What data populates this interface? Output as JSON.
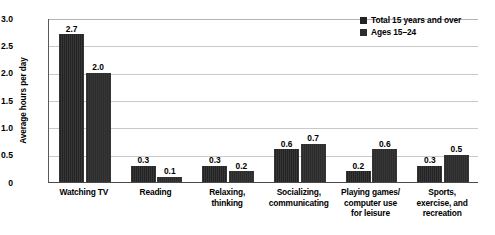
{
  "chart_data": {
    "type": "bar",
    "title": "",
    "subtitle": "",
    "xlabel": "",
    "ylabel": "Average hours per day",
    "ylim": [
      0,
      3.0
    ],
    "yticks": [
      0,
      0.5,
      1.0,
      1.5,
      2.0,
      2.5,
      3.0
    ],
    "ytick_labels": [
      "0",
      "0.5",
      "1.0",
      "1.5",
      "2.0",
      "2.5",
      "3.0"
    ],
    "grid": true,
    "legend_position": "top-right",
    "orientation": "vertical",
    "grouping": "grouped",
    "categories": [
      "Watching TV",
      "Reading",
      "Relaxing,\nthinking",
      "Socializing,\ncommunicating",
      "Playing games/\ncomputer use\nfor leisure",
      "Sports,\nexercise, and\nrecreation"
    ],
    "category_lines": [
      [
        "Watching TV"
      ],
      [
        "Reading"
      ],
      [
        "Relaxing,",
        "thinking"
      ],
      [
        "Socializing,",
        "communicating"
      ],
      [
        "Playing games/",
        "computer use",
        "for leisure"
      ],
      [
        "Sports,",
        "exercise, and",
        "recreation"
      ]
    ],
    "series": [
      {
        "name": "Total 15 years and over",
        "color": "#232323",
        "values": [
          2.7,
          0.3,
          0.3,
          0.6,
          0.2,
          0.3
        ],
        "value_labels": [
          "2.7",
          "0.3",
          "0.3",
          "0.6",
          "0.2",
          "0.3"
        ]
      },
      {
        "name": "Ages 15–24",
        "color": "#2c2c2c",
        "values": [
          2.0,
          0.1,
          0.2,
          0.7,
          0.6,
          0.5
        ],
        "value_labels": [
          "2.0",
          "0.1",
          "0.2",
          "0.7",
          "0.6",
          "0.5"
        ]
      }
    ]
  },
  "legend": {
    "items": [
      {
        "label": "Total 15 years and over"
      },
      {
        "label": "Ages 15–24"
      }
    ]
  },
  "colors": {
    "series_total": "#232323",
    "series_ages": "#2c2c2c",
    "gridline": "#c9c9c9",
    "axis": "#4a4a4a",
    "background": "#ffffff",
    "text": "#000000"
  }
}
